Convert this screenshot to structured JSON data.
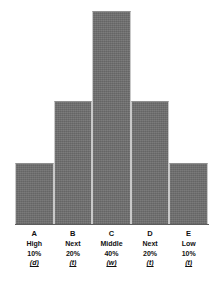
{
  "chart_data": {
    "type": "bar",
    "title": "",
    "subtitle": "",
    "xlabel": "",
    "ylabel": "",
    "categories": [
      "A",
      "B",
      "C",
      "D",
      "E"
    ],
    "values": [
      10,
      20,
      40,
      20,
      10
    ],
    "ylim": [
      0,
      40
    ],
    "grid": false,
    "legend": null,
    "bar_color": "#6e6e6e",
    "tick_labels": [
      "A",
      "B",
      "C",
      "D",
      "E"
    ],
    "tier_labels": [
      "High",
      "Next",
      "Middle",
      "Next",
      "Low"
    ],
    "percent_labels": [
      "10%",
      "20%",
      "40%",
      "20%",
      "10%"
    ],
    "annotations": [
      "(d)",
      "(t)",
      "(w)",
      "(t)",
      "(t)"
    ]
  },
  "chart": {
    "bars": [
      {
        "letter": "A",
        "tier": "High",
        "percent": "10%",
        "note": "(d)",
        "value": 10,
        "height_class": "h-10"
      },
      {
        "letter": "B",
        "tier": "Next",
        "percent": "20%",
        "note": "(t)",
        "value": 20,
        "height_class": "h-20"
      },
      {
        "letter": "C",
        "tier": "Middle",
        "percent": "40%",
        "note": "(w)",
        "value": 40,
        "height_class": "h-40"
      },
      {
        "letter": "D",
        "tier": "Next",
        "percent": "20%",
        "note": "(t)",
        "value": 20,
        "height_class": "h-20"
      },
      {
        "letter": "E",
        "tier": "Low",
        "percent": "10%",
        "note": "(t)",
        "value": 10,
        "height_class": "h-10"
      }
    ]
  }
}
